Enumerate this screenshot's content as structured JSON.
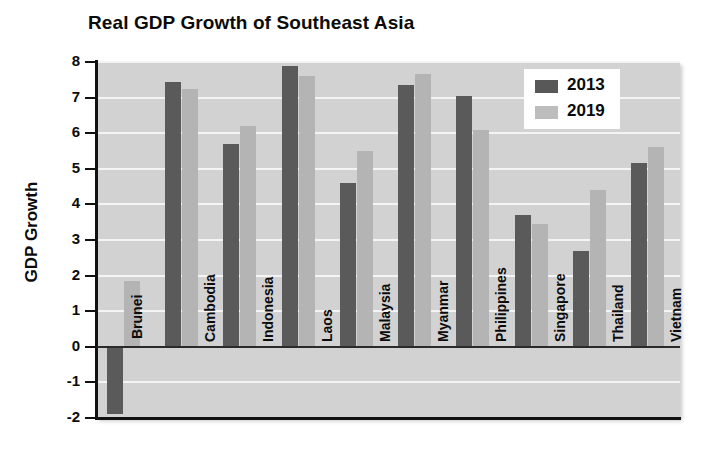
{
  "chart_data": {
    "type": "bar",
    "title": "Real GDP Growth of Southeast Asia",
    "xlabel": "",
    "ylabel": "GDP Growth",
    "ylim": [
      -2,
      8
    ],
    "ytick_step": 1,
    "yticks": [
      "8",
      "7",
      "6",
      "5",
      "4",
      "3",
      "2",
      "1",
      "0",
      "-1",
      "-2"
    ],
    "grid": true,
    "legend_position": "upper right",
    "categories": [
      "Brunei",
      "Cambodia",
      "Indonesia",
      "Laos",
      "Malaysia",
      "Myanmar",
      "Philippines",
      "Singapore",
      "Thailand",
      "Vietnam"
    ],
    "series": [
      {
        "name": "2013",
        "color": "#5a5a5a",
        "values": [
          -1.9,
          7.45,
          5.7,
          7.9,
          4.6,
          7.35,
          7.05,
          3.7,
          2.7,
          5.15
        ]
      },
      {
        "name": "2019",
        "color": "#b4b4b4",
        "values": [
          1.85,
          7.25,
          6.2,
          7.6,
          5.5,
          7.65,
          6.1,
          3.45,
          4.4,
          5.6
        ]
      }
    ]
  },
  "legend": {
    "entries": [
      {
        "label": "2013"
      },
      {
        "label": "2019"
      }
    ]
  },
  "colors": {
    "series_2013": "#5a5a5a",
    "series_2019": "#b4b4b4",
    "plot_background": "#d2d2d2",
    "gridline": "#f4f4f4",
    "axis": "#111111"
  }
}
